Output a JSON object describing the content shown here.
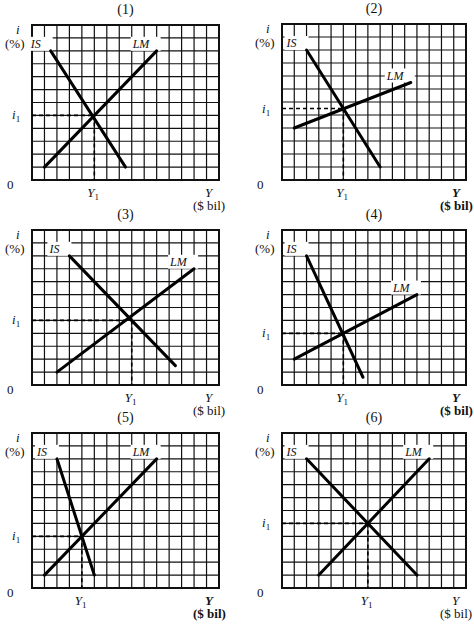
{
  "figure": {
    "axis_labels": {
      "y_symbol": "i",
      "y_unit": "(%)",
      "x_symbol": "Y",
      "x_unit": "($ bil)",
      "origin": "0",
      "i_eq": "i",
      "i_eq_sub": "1",
      "y_eq": "Y",
      "y_eq_sub": "1",
      "is_label": "IS",
      "lm_label": "LM"
    },
    "colors": {
      "grid": "#111111",
      "curve": "#000000",
      "background": "#ffffff"
    }
  },
  "chart_data": [
    {
      "type": "line",
      "title": "(1)",
      "xlabel": "Y ($ bil)",
      "ylabel": "i (%)",
      "grid": true,
      "grid_cols": 15,
      "grid_rows": 12,
      "series": [
        {
          "name": "IS",
          "x": [
            1.5,
            7.5
          ],
          "y": [
            10,
            1
          ]
        },
        {
          "name": "LM",
          "x": [
            1,
            10
          ],
          "y": [
            1,
            10
          ]
        }
      ],
      "equilibrium": {
        "Y1": 5,
        "i1": 5
      }
    },
    {
      "type": "line",
      "title": "(2)",
      "xlabel": "Y ($ bil)",
      "ylabel": "i (%)",
      "grid": true,
      "grid_cols": 15,
      "grid_rows": 12,
      "series": [
        {
          "name": "IS",
          "x": [
            2,
            8
          ],
          "y": [
            10,
            1
          ]
        },
        {
          "name": "LM",
          "x": [
            1,
            10.5
          ],
          "y": [
            4,
            7.5
          ]
        }
      ],
      "equilibrium": {
        "Y1": 5,
        "i1": 5.5
      }
    },
    {
      "type": "line",
      "title": "(3)",
      "xlabel": "Y ($ bil)",
      "ylabel": "i (%)",
      "grid": true,
      "grid_cols": 15,
      "grid_rows": 12,
      "series": [
        {
          "name": "IS",
          "x": [
            3,
            11.5
          ],
          "y": [
            10,
            1.5
          ]
        },
        {
          "name": "LM",
          "x": [
            2,
            13
          ],
          "y": [
            1,
            9
          ]
        }
      ],
      "equilibrium": {
        "Y1": 8,
        "i1": 5
      }
    },
    {
      "type": "line",
      "title": "(4)",
      "xlabel": "Y ($ bil)",
      "ylabel": "i (%)",
      "grid": true,
      "grid_cols": 15,
      "grid_rows": 12,
      "series": [
        {
          "name": "IS",
          "x": [
            2,
            6.6
          ],
          "y": [
            10,
            0.6
          ]
        },
        {
          "name": "LM",
          "x": [
            1,
            11
          ],
          "y": [
            2,
            7
          ]
        }
      ],
      "equilibrium": {
        "Y1": 5,
        "i1": 4
      }
    },
    {
      "type": "line",
      "title": "(5)",
      "xlabel": "Y ($ bil)",
      "ylabel": "i (%)",
      "grid": true,
      "grid_cols": 15,
      "grid_rows": 12,
      "series": [
        {
          "name": "IS",
          "x": [
            2,
            5
          ],
          "y": [
            10,
            1
          ]
        },
        {
          "name": "LM",
          "x": [
            1,
            10
          ],
          "y": [
            1,
            10
          ]
        }
      ],
      "equilibrium": {
        "Y1": 4,
        "i1": 4
      }
    },
    {
      "type": "line",
      "title": "(6)",
      "xlabel": "Y ($ bil)",
      "ylabel": "i (%)",
      "grid": true,
      "grid_cols": 15,
      "grid_rows": 12,
      "series": [
        {
          "name": "IS",
          "x": [
            2,
            11
          ],
          "y": [
            10,
            1
          ]
        },
        {
          "name": "LM",
          "x": [
            3,
            12
          ],
          "y": [
            1,
            10
          ]
        }
      ],
      "equilibrium": {
        "Y1": 7,
        "i1": 5
      }
    }
  ]
}
